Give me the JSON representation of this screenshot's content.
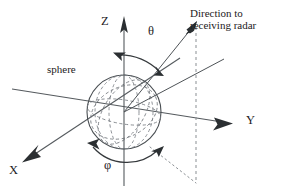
{
  "figure": {
    "type": "coordinate-system-diagram",
    "title_text": "",
    "background_color": "#ffffff",
    "line_color": "#4e5357",
    "text_color": "#1d2123",
    "width_px": 282,
    "height_px": 196
  },
  "labels": {
    "z_axis": "Z",
    "y_axis": "Y",
    "x_axis": "X",
    "theta": "θ",
    "phi": "φ",
    "sphere": "sphere",
    "radar_direction_line1": "Direction to",
    "radar_direction_line2": "receiving radar"
  },
  "geometry": {
    "origin": {
      "x": 124,
      "y": 112
    },
    "sphere": {
      "center_x": 124,
      "center_y": 112,
      "radius": 37
    },
    "z_axis": {
      "x1": 124,
      "y1": 18,
      "x2": 124,
      "y2": 186,
      "arrow_at": "top"
    },
    "y_axis": {
      "x1": 12,
      "y1": 89,
      "x2": 231,
      "y2": 123,
      "arrow_at": "right"
    },
    "x_axis": {
      "x1": 180,
      "y1": 58,
      "x2": 24,
      "y2": 161,
      "arrow_at": "lower-left"
    },
    "radar_ray": {
      "x1": 124,
      "y1": 112,
      "x2": 196,
      "y2": 23,
      "arrow_at": "upper-right"
    },
    "dashed_drop": {
      "x1": 196,
      "y1": 25,
      "x2": 196,
      "y2": 182
    },
    "dotted_ground": {
      "x1": 149,
      "y1": 146,
      "x2": 196,
      "y2": 182
    },
    "theta_arc": {
      "label": "θ",
      "double_headed": true
    },
    "phi_arc": {
      "label": "φ",
      "double_headed": true
    }
  },
  "elements": {
    "icons": {
      "z_arrow": "arrow-up-icon",
      "y_arrow": "arrow-right-icon",
      "x_arrow": "arrow-down-left-icon",
      "radar_arrow": "arrow-up-right-icon",
      "theta_arrow_start": "arc-arrow-icon",
      "theta_arrow_end": "arc-arrow-icon",
      "phi_arrow_start": "arc-arrow-icon",
      "phi_arrow_end": "arc-arrow-icon"
    }
  }
}
